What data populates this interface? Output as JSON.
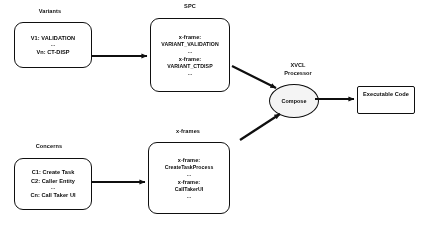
{
  "diagram": {
    "stroke_color": "#111111",
    "background_color": "#ffffff",
    "ellipse_fill": "#f2f2f2",
    "headers": {
      "variants": "Variants",
      "spc": "SPC",
      "xframes": "x-frames",
      "concerns": "Concerns"
    },
    "variants_box": {
      "line1": "V1: VALIDATION",
      "ellipsis": "...",
      "line2": "Vn: CT-DISP"
    },
    "spc_box": {
      "line1_key": "x-frame:",
      "line1_value": "VARIANT_VALIDATION",
      "ellipsis1": "...",
      "line2_key": "x-frame:",
      "line2_value": "VARIANT_CTDISP",
      "ellipsis2": "..."
    },
    "concerns_box": {
      "line1": "C1: Create Task",
      "line2": "C2: Caller Entity",
      "ellipsis": "...",
      "line3": "Cn: Call Taker UI"
    },
    "xframes_box": {
      "line1_key": "x-frame:",
      "line1_value": "CreateTaskProcess",
      "ellipsis1": "...",
      "line2_key": "x-frame:",
      "line2_value": "CallTakerUI",
      "ellipsis2": "..."
    },
    "processor": {
      "label_line1": "XVCL",
      "label_line2": "Processor",
      "node_label": "Compose"
    },
    "output_box": {
      "label": "Executable Code"
    }
  }
}
